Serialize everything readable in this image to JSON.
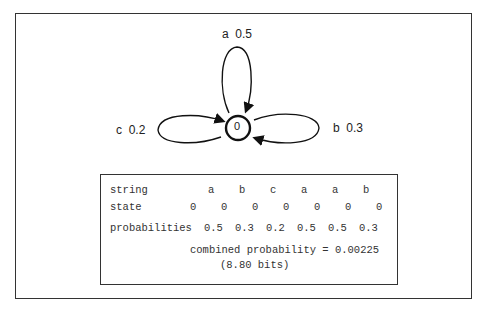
{
  "diagram": {
    "state": "0",
    "loops": [
      {
        "symbol": "a",
        "prob": "0.5",
        "label": "a  0.5",
        "position": "top"
      },
      {
        "symbol": "b",
        "prob": "0.3",
        "label": "b  0.3",
        "position": "right"
      },
      {
        "symbol": "c",
        "prob": "0.2",
        "label": "c  0.2",
        "position": "left"
      }
    ]
  },
  "table": {
    "row_labels": {
      "string": "string",
      "state": "state",
      "probabilities": "probabilities"
    },
    "string": [
      "a",
      "b",
      "c",
      "a",
      "a",
      "b"
    ],
    "states": [
      "0",
      "0",
      "0",
      "0",
      "0",
      "0",
      "0"
    ],
    "probabilities": [
      "0.5",
      "0.3",
      "0.2",
      "0.5",
      "0.5",
      "0.3"
    ],
    "combined": "combined probability = 0.00225",
    "bits": "(8.80 bits)"
  }
}
